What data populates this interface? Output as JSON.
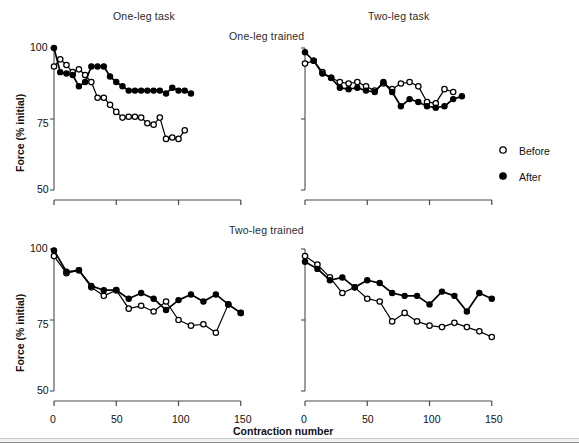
{
  "figure": {
    "column_titles": [
      "One-leg task",
      "Two-leg task"
    ],
    "row_titles": [
      "One-leg trained",
      "Two-leg trained"
    ],
    "y_axis_label": "Force (% initial)",
    "x_axis_label": "Contraction number",
    "y_ticks": [
      "50",
      "75",
      "100"
    ],
    "x_ticks": [
      "0",
      "50",
      "100",
      "150"
    ],
    "legend": [
      {
        "label": "Before",
        "marker": "open-circle"
      },
      {
        "label": "After",
        "marker": "filled-circle"
      }
    ],
    "colors": {
      "line": "#000000",
      "marker_fill_after": "#000000",
      "marker_fill_before": "#ffffff",
      "axis": "#555555"
    }
  },
  "chart_data": [
    {
      "type": "line",
      "panel": "top-left",
      "title": "One-leg trained — One-leg task",
      "xlabel": "Contraction number",
      "ylabel": "Force (% initial)",
      "xlim": [
        0,
        155
      ],
      "ylim": [
        50,
        100
      ],
      "grid": false,
      "legend_position": "outside-right",
      "x": [
        0,
        5,
        10,
        15,
        20,
        25,
        30,
        35,
        40,
        45,
        50,
        55,
        60,
        65,
        70,
        75,
        80,
        85,
        90,
        95,
        100,
        105,
        110,
        115,
        120,
        125,
        130,
        135,
        140,
        145,
        150
      ],
      "series": [
        {
          "name": "Before",
          "marker": "open-circle",
          "values": [
            93.5,
            96.0,
            94.0,
            91.5,
            92.5,
            90.5,
            88.0,
            82.5,
            82.5,
            80.0,
            77.5,
            75.5,
            75.8,
            75.8,
            75.5,
            73.5,
            73.0,
            75.5,
            68.0,
            68.5,
            68.0,
            71.0
          ]
        },
        {
          "name": "After",
          "marker": "filled-circle",
          "values": [
            100.0,
            91.5,
            91.0,
            90.5,
            86.5,
            88.0,
            93.5,
            93.5,
            93.5,
            90.0,
            88.0,
            86.5,
            85.0,
            85.0,
            85.0,
            85.0,
            85.0,
            85.0,
            84.0,
            86.0,
            85.0,
            85.0,
            84.0
          ]
        }
      ]
    },
    {
      "type": "line",
      "panel": "top-right",
      "title": "One-leg trained — Two-leg task",
      "xlabel": "Contraction number",
      "ylabel": "Force (% initial)",
      "xlim": [
        0,
        155
      ],
      "ylim": [
        50,
        100
      ],
      "grid": false,
      "x": [
        0,
        7,
        14,
        21,
        28,
        35,
        42,
        49,
        56,
        63,
        70,
        77,
        84,
        91,
        98,
        105,
        112,
        119,
        126,
        133,
        140,
        147
      ],
      "series": [
        {
          "name": "Before",
          "marker": "open-circle",
          "values": [
            94.5,
            95.5,
            91.5,
            89.5,
            88.0,
            87.5,
            88.0,
            86.5,
            85.0,
            87.5,
            85.5,
            87.5,
            88.0,
            86.5,
            81.0,
            80.5,
            85.5,
            84.5
          ]
        },
        {
          "name": "After",
          "marker": "filled-circle",
          "values": [
            98.5,
            95.5,
            91.0,
            89.5,
            86.0,
            85.5,
            86.0,
            85.0,
            84.5,
            88.0,
            84.5,
            79.5,
            82.0,
            81.0,
            79.5,
            79.0,
            79.5,
            82.0,
            83.0
          ]
        }
      ]
    },
    {
      "type": "line",
      "panel": "bottom-left",
      "title": "Two-leg trained — One-leg task",
      "xlabel": "Contraction number",
      "ylabel": "Force (% initial)",
      "xlim": [
        0,
        155
      ],
      "ylim": [
        50,
        100
      ],
      "grid": false,
      "x": [
        0,
        10,
        20,
        30,
        40,
        50,
        60,
        70,
        80,
        90,
        100,
        110,
        120,
        130,
        140,
        150
      ],
      "series": [
        {
          "name": "Before",
          "marker": "open-circle",
          "values": [
            97.5,
            91.5,
            92.5,
            86.5,
            83.5,
            85.5,
            79.0,
            80.0,
            78.0,
            81.5,
            75.0,
            73.0,
            73.5,
            70.5,
            80.5,
            77.5
          ]
        },
        {
          "name": "After",
          "marker": "filled-circle",
          "values": [
            99.5,
            92.0,
            92.5,
            87.0,
            85.5,
            85.5,
            82.5,
            84.5,
            82.5,
            78.5,
            82.0,
            84.0,
            81.5,
            84.0,
            80.5,
            77.5
          ]
        }
      ]
    },
    {
      "type": "line",
      "panel": "bottom-right",
      "title": "Two-leg trained — Two-leg task",
      "xlabel": "Contraction number",
      "ylabel": "Force (% initial)",
      "xlim": [
        0,
        155
      ],
      "ylim": [
        50,
        100
      ],
      "grid": false,
      "x": [
        0,
        10,
        20,
        30,
        40,
        50,
        60,
        70,
        80,
        90,
        100,
        110,
        120,
        130,
        140,
        150
      ],
      "series": [
        {
          "name": "Before",
          "marker": "open-circle",
          "values": [
            97.5,
            94.5,
            90.0,
            84.5,
            86.5,
            82.5,
            81.5,
            74.5,
            77.5,
            74.5,
            73.0,
            72.5,
            74.0,
            72.5,
            71.0,
            69.0
          ]
        },
        {
          "name": "After",
          "marker": "filled-circle",
          "values": [
            95.5,
            93.0,
            89.0,
            90.0,
            86.5,
            89.0,
            88.0,
            84.5,
            83.5,
            83.5,
            80.5,
            85.0,
            83.5,
            78.0,
            84.5,
            82.5
          ]
        }
      ]
    }
  ]
}
